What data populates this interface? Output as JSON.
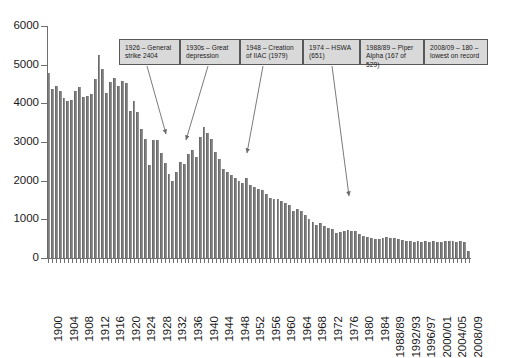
{
  "chart_data": {
    "type": "bar",
    "title": "",
    "xlabel": "",
    "ylabel": "",
    "ylim": [
      0,
      6000
    ],
    "ytick_values": [
      0,
      1000,
      2000,
      3000,
      4000,
      5000,
      6000
    ],
    "ytick_labels": [
      "0",
      "1000",
      "2000",
      "3000",
      "4000",
      "5000",
      "6000"
    ],
    "grid": false,
    "legend": "none",
    "bar_color": "#7d7d7d",
    "categories": [
      "1900",
      "1901",
      "1902",
      "1903",
      "1904",
      "1905",
      "1906",
      "1907",
      "1908",
      "1909",
      "1910",
      "1911",
      "1912",
      "1913",
      "1914",
      "1915",
      "1916",
      "1917",
      "1918",
      "1919",
      "1920",
      "1921",
      "1922",
      "1923",
      "1924",
      "1925",
      "1926",
      "1927",
      "1928",
      "1929",
      "1930",
      "1931",
      "1932",
      "1933",
      "1934",
      "1935",
      "1936",
      "1937",
      "1938",
      "1939",
      "1940",
      "1941",
      "1942",
      "1943",
      "1944",
      "1945",
      "1946",
      "1947",
      "1948",
      "1949",
      "1950",
      "1951",
      "1952",
      "1953",
      "1954",
      "1955",
      "1956",
      "1957",
      "1958",
      "1959",
      "1960",
      "1961",
      "1962",
      "1963",
      "1964",
      "1965",
      "1966",
      "1967",
      "1968",
      "1969",
      "1970",
      "1971",
      "1972",
      "1973",
      "1974",
      "1975",
      "1976",
      "1977",
      "1978",
      "1979",
      "1980",
      "1981",
      "1982",
      "1983",
      "1984",
      "1985/86",
      "1986/87",
      "1987/88",
      "1988/89",
      "1989/90",
      "1990/91",
      "1991/92",
      "1992/93",
      "1993/94",
      "1994/95",
      "1995/96",
      "1996/97",
      "1997/98",
      "1998/99",
      "1999/00",
      "2000/01",
      "2001/02",
      "2002/03",
      "2003/04",
      "2004/05",
      "2005/06",
      "2006/07",
      "2007/08",
      "2008/09"
    ],
    "values": [
      4790,
      4380,
      4460,
      4330,
      4130,
      4060,
      4080,
      4320,
      4430,
      4170,
      4180,
      4240,
      4620,
      5250,
      4880,
      4280,
      4540,
      4650,
      4460,
      4580,
      4520,
      3790,
      4050,
      3770,
      3330,
      3070,
      2404,
      3060,
      3050,
      2720,
      2470,
      2160,
      1990,
      2220,
      2480,
      2420,
      2680,
      2800,
      2600,
      3120,
      3400,
      3240,
      3070,
      2740,
      2570,
      2290,
      2220,
      2150,
      2070,
      1990,
      1930,
      2060,
      1890,
      1840,
      1780,
      1770,
      1660,
      1560,
      1530,
      1530,
      1470,
      1420,
      1370,
      1220,
      1260,
      1210,
      1100,
      1020,
      940,
      860,
      900,
      820,
      780,
      740,
      651,
      660,
      700,
      720,
      700,
      690,
      620,
      560,
      540,
      510,
      500,
      490,
      520,
      540,
      529,
      520,
      500,
      470,
      450,
      430,
      420,
      430,
      420,
      430,
      420,
      430,
      420,
      420,
      430,
      440,
      430,
      420,
      430,
      420,
      180
    ],
    "xtick_labels": [
      {
        "label": "1900",
        "index": 0
      },
      {
        "label": "1904",
        "index": 4
      },
      {
        "label": "1908",
        "index": 8
      },
      {
        "label": "1912",
        "index": 12
      },
      {
        "label": "1916",
        "index": 16
      },
      {
        "label": "1920",
        "index": 20
      },
      {
        "label": "1924",
        "index": 24
      },
      {
        "label": "1928",
        "index": 28
      },
      {
        "label": "1932",
        "index": 32
      },
      {
        "label": "1936",
        "index": 36
      },
      {
        "label": "1940",
        "index": 40
      },
      {
        "label": "1944",
        "index": 44
      },
      {
        "label": "1948",
        "index": 48
      },
      {
        "label": "1952",
        "index": 52
      },
      {
        "label": "1956",
        "index": 56
      },
      {
        "label": "1960",
        "index": 60
      },
      {
        "label": "1964",
        "index": 64
      },
      {
        "label": "1968",
        "index": 68
      },
      {
        "label": "1972",
        "index": 72
      },
      {
        "label": "1976",
        "index": 76
      },
      {
        "label": "1980",
        "index": 80
      },
      {
        "label": "1984",
        "index": 84
      },
      {
        "label": "1988/89",
        "index": 88
      },
      {
        "label": "1992/93",
        "index": 92
      },
      {
        "label": "1996/97",
        "index": 96
      },
      {
        "label": "2000/01",
        "index": 100
      },
      {
        "label": "2004/05",
        "index": 104
      },
      {
        "label": "2008/09",
        "index": 108
      }
    ],
    "annotations": [
      {
        "id": "general-strike",
        "line1": "1926 – General",
        "line2": "strike 2404",
        "box": {
          "x": 119,
          "y": 39,
          "w": 61,
          "h": 26
        },
        "arrow": {
          "x1": 147,
          "y1": 66,
          "x2": 166,
          "y2": 134
        }
      },
      {
        "id": "great-depression",
        "line1": "1930s – Great",
        "line2": "depression",
        "box": {
          "x": 180,
          "y": 39,
          "w": 60,
          "h": 26
        },
        "arrow": {
          "x1": 208,
          "y1": 66,
          "x2": 186,
          "y2": 140
        }
      },
      {
        "id": "iiac-creation",
        "line1": "1948 – Creation",
        "line2": "of IIAC (1979)",
        "box": {
          "x": 240,
          "y": 39,
          "w": 63,
          "h": 26
        },
        "arrow": {
          "x1": 263,
          "y1": 66,
          "x2": 247,
          "y2": 153
        }
      },
      {
        "id": "hswa",
        "line1": "1974 – HSWA",
        "line2": "(651)",
        "box": {
          "x": 303,
          "y": 39,
          "w": 57,
          "h": 26
        },
        "arrow": {
          "x1": 332,
          "y1": 66,
          "x2": 349,
          "y2": 196
        }
      },
      {
        "id": "piper-alpha",
        "line1": "1988/89 – Piper",
        "line2": "Alpha (167 of 529)",
        "box": {
          "x": 360,
          "y": 39,
          "w": 64,
          "h": 26
        },
        "arrow": null
      },
      {
        "id": "lowest-on-record",
        "line1": "2008/09 – 180 –",
        "line2": "lowest on record",
        "box": {
          "x": 424,
          "y": 39,
          "w": 64,
          "h": 26
        },
        "arrow": null
      }
    ]
  }
}
